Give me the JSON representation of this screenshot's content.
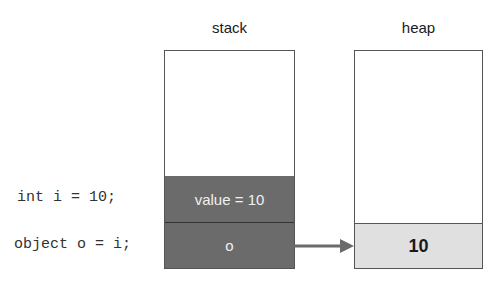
{
  "stack": {
    "title": "stack",
    "cells": [
      {
        "label": "value = 10"
      },
      {
        "label": "o"
      }
    ]
  },
  "heap": {
    "title": "heap",
    "cells": [
      {
        "label": "10"
      }
    ]
  },
  "code": [
    "int i = 10;",
    "object o = i;"
  ],
  "colors": {
    "stack_cell": "#6b6b6b",
    "heap_cell": "#e0e0e0",
    "arrow": "#6b6b6b",
    "border": "#555555"
  }
}
